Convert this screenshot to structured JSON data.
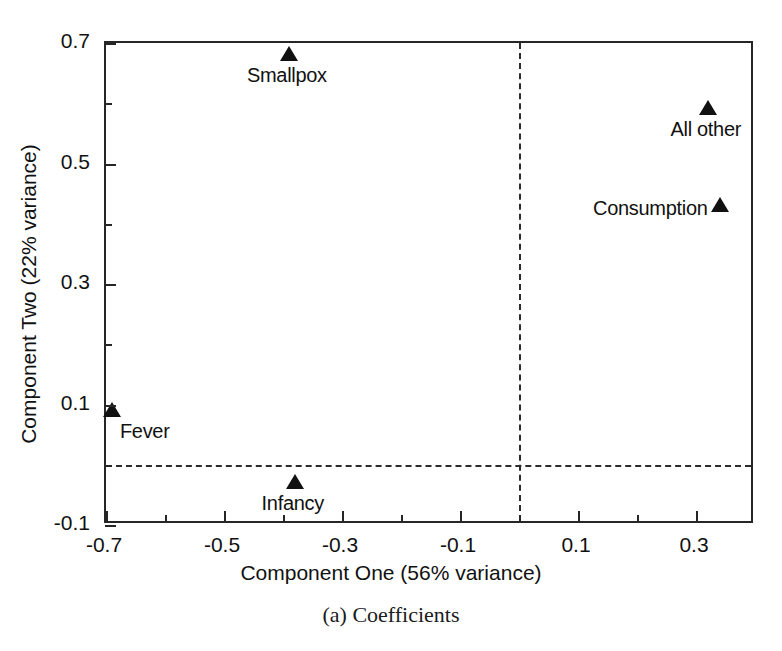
{
  "caption": "(a) Coefficients",
  "chart_data": {
    "type": "scatter",
    "title": "",
    "xlabel": "Component One (56% variance)",
    "ylabel": "Component Two (22% variance)",
    "xlim": [
      -0.7,
      0.4
    ],
    "ylim": [
      -0.1,
      0.7
    ],
    "grid": false,
    "legend": "none",
    "marker": "filled-triangle",
    "marker_color": "#111111",
    "reference_lines": [
      {
        "axis": "x",
        "value": 0,
        "style": "dashed"
      },
      {
        "axis": "y",
        "value": 0,
        "style": "dashed"
      }
    ],
    "xticks": [
      -0.7,
      -0.5,
      -0.3,
      -0.1,
      0.1,
      0.3
    ],
    "xticklabels": [
      "-0.7",
      "-0.5",
      "-0.3",
      "-0.1",
      "0.1",
      "0.3"
    ],
    "xminorticks": [
      -0.6,
      -0.4,
      -0.2,
      0.0,
      0.2
    ],
    "yticks": [
      0.7,
      0.5,
      0.3,
      0.1,
      -0.1
    ],
    "yticklabels": [
      "0.7",
      "0.5",
      "0.3",
      "0.1",
      "-0.1"
    ],
    "yminorticks": [
      0.6,
      0.4,
      0.2,
      0.0
    ],
    "points": [
      {
        "label": "Smallpox",
        "x": -0.39,
        "y": 0.68,
        "label_dx": -2,
        "label_dy": 20,
        "label_anchor": "center"
      },
      {
        "label": "All other",
        "x": 0.32,
        "y": 0.59,
        "label_dx": -2,
        "label_dy": 20,
        "label_anchor": "center"
      },
      {
        "label": "Consumption",
        "x": 0.34,
        "y": 0.43,
        "label_dx": -12,
        "label_dy": 2,
        "label_anchor": "right"
      },
      {
        "label": "Fever",
        "x": -0.69,
        "y": 0.09,
        "label_dx": 8,
        "label_dy": 20,
        "label_anchor": "left"
      },
      {
        "label": "Infancy",
        "x": -0.38,
        "y": -0.03,
        "label_dx": -2,
        "label_dy": 20,
        "label_anchor": "center"
      }
    ]
  }
}
